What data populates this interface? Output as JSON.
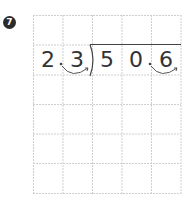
{
  "problem": {
    "number": "7",
    "divisor": [
      "2",
      ".",
      "3"
    ],
    "dividend": [
      "5",
      "0",
      ".",
      "6"
    ],
    "digits": [
      {
        "char": "2",
        "x": 44
      },
      {
        "char": "3",
        "x": 73
      },
      {
        "char": "5",
        "x": 102
      },
      {
        "char": "0",
        "x": 131
      },
      {
        "char": "6",
        "x": 161
      }
    ],
    "decimal_points": [
      {
        "x": 61
      },
      {
        "x": 150
      }
    ]
  },
  "grid": {
    "columns": 5,
    "rows": 6,
    "cell_size": 29.6,
    "line_color": "#c8c8c8"
  },
  "colors": {
    "ink": "#333333",
    "badge": "#2b2b2b"
  }
}
